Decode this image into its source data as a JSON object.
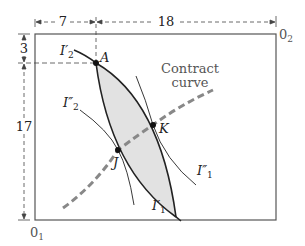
{
  "diagram": {
    "type": "edgeworth-box",
    "origins": {
      "consumer1": "0",
      "consumer1_sub": "1",
      "consumer2": "0",
      "consumer2_sub": "2"
    },
    "dimensions": {
      "top_left_segment": "7",
      "top_right_segment": "18",
      "left_top_segment": "3",
      "left_bottom_segment": "17"
    },
    "points": {
      "A": "A",
      "K": "K",
      "J": "J"
    },
    "curves": {
      "I2_prime": {
        "base": "I",
        "sub": "2",
        "mark": "′"
      },
      "I2_dprime": {
        "base": "I",
        "sub": "2",
        "mark": "″"
      },
      "I1_prime": {
        "base": "I",
        "sub": "1",
        "mark": "′"
      },
      "I1_dprime": {
        "base": "I",
        "sub": "1",
        "mark": "″"
      }
    },
    "contract_curve_label": {
      "line1": "Contract",
      "line2": "curve"
    },
    "colors": {
      "lens_fill": "#e2e2e2",
      "contract_curve": "#888888",
      "lines": "#222222",
      "box": "#555555"
    }
  }
}
